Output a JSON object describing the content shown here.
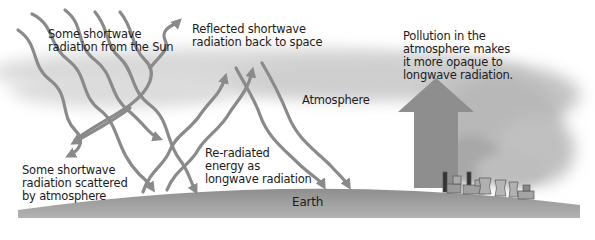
{
  "diagram": {
    "colors": {
      "arrow": "#8a8a8a",
      "atmosphere": "#cfcfcf",
      "earth": "#9a9a9a",
      "smoke": "#b5b5b5",
      "big_arrow": "#8c8c8c",
      "text": "#1c1c1c"
    },
    "labels": {
      "sun_radiation": [
        "Some shortwave",
        "radiation from the Sun"
      ],
      "reflected": [
        "Reflected shortwave",
        "radiation back to space"
      ],
      "atmosphere": "Atmosphere",
      "pollution": [
        "Pollution in the",
        "atmosphere makes",
        "it more opaque to",
        "longwave radiation."
      ],
      "scattered": [
        "Some shortwave",
        "radiation scattered",
        "by atmosphere"
      ],
      "reradiated": [
        "Re-radiated",
        "energy as",
        "longwave radiation"
      ],
      "earth": "Earth"
    },
    "elements": {
      "incoming_arrows": 5,
      "reflected_arrows": 1,
      "scattered_arrows": 1,
      "reradiated_arrows": 2,
      "downward_longwave_arrows": 2,
      "big_longwave_arrow": 1,
      "factory_stacks": 3,
      "cooling_towers": 3
    }
  }
}
